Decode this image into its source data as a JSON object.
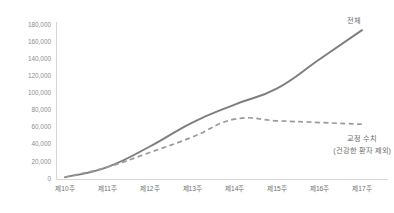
{
  "chart_data": {
    "type": "line",
    "title": "",
    "xlabel": "",
    "ylabel": "",
    "categories": [
      "제10주",
      "제11주",
      "제12주",
      "제13주",
      "제14주",
      "제15주",
      "제16주",
      "제17주"
    ],
    "ylim": [
      0,
      180000
    ],
    "ytick_labels": [
      "180,000",
      "160,000",
      "140,000",
      "120,000",
      "100,000",
      "80,000",
      "60,000",
      "40,000",
      "20,000",
      "0"
    ],
    "ytick_values": [
      180000,
      160000,
      140000,
      120000,
      100000,
      80000,
      60000,
      40000,
      20000,
      0
    ],
    "grid": false,
    "legend_position": "inline-annotation",
    "series": [
      {
        "name": "전체",
        "style": "solid",
        "color": "#7d7d7d",
        "label_text": "전체",
        "values": [
          2000,
          14000,
          38000,
          66000,
          87000,
          106000,
          140000,
          174000
        ]
      },
      {
        "name": "교정 수치 (건강한 환자 제외)",
        "style": "dashed",
        "color": "#9a9a9a",
        "label_line1": "교정 수치",
        "label_line2": "(건강한 환자 제외)",
        "values": [
          2000,
          14000,
          31000,
          49000,
          70000,
          68000,
          66000,
          64000
        ]
      }
    ]
  },
  "colors": {
    "background": "#ffffff",
    "axis": "#cccccc",
    "tick_text": "#8c8c8c",
    "category_text": "#6f6f6f",
    "annotation_text": "#6a6a6a"
  }
}
